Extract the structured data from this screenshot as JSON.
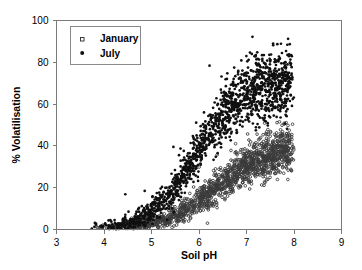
{
  "chart_data": {
    "type": "scatter",
    "title": "",
    "xlabel": "Soil pH",
    "ylabel": "% Volatilisation",
    "xlim": [
      3,
      9
    ],
    "ylim": [
      0,
      100
    ],
    "xticks": [
      3,
      4,
      5,
      6,
      7,
      8,
      9
    ],
    "yticks": [
      0,
      20,
      40,
      60,
      80,
      100
    ],
    "grid": false,
    "legend_position": "top-left",
    "series": [
      {
        "name": "January",
        "marker": "open-square",
        "color": "#3a3a3a",
        "n_points": 1500,
        "description": "Open markers; sigmoidal rise from ~0% at pH 3.7 to a plateau near 38-42% by pH 7.3-8.0",
        "curve": {
          "model": "logistic",
          "plateau": 40,
          "midpoint_ph": 6.35,
          "steepness": 1.85,
          "x_start": 3.7,
          "x_end": 7.95,
          "scatter_sd": 4.2
        },
        "sample_points": [
          {
            "x": 3.8,
            "y": 0.4
          },
          {
            "x": 4.1,
            "y": 0.6
          },
          {
            "x": 4.4,
            "y": 0.9
          },
          {
            "x": 4.7,
            "y": 1.4
          },
          {
            "x": 5.0,
            "y": 2.3
          },
          {
            "x": 5.3,
            "y": 4.0
          },
          {
            "x": 5.6,
            "y": 7.0
          },
          {
            "x": 5.9,
            "y": 12.0
          },
          {
            "x": 6.2,
            "y": 18.0
          },
          {
            "x": 6.5,
            "y": 24.0
          },
          {
            "x": 6.8,
            "y": 30.0
          },
          {
            "x": 7.1,
            "y": 34.5
          },
          {
            "x": 7.4,
            "y": 37.5
          },
          {
            "x": 7.7,
            "y": 39.0
          },
          {
            "x": 7.9,
            "y": 40.0
          }
        ]
      },
      {
        "name": "July",
        "marker": "filled-circle",
        "color": "#101010",
        "n_points": 1500,
        "description": "Filled markers; sigmoidal rise from ~0% at pH 3.7 to a plateau near 68-75% by pH 7.0-8.0",
        "curve": {
          "model": "logistic",
          "plateau": 72,
          "midpoint_ph": 5.95,
          "steepness": 2.05,
          "x_start": 3.7,
          "x_end": 7.95,
          "scatter_sd": 6.0
        },
        "sample_points": [
          {
            "x": 3.8,
            "y": 0.5
          },
          {
            "x": 4.1,
            "y": 0.9
          },
          {
            "x": 4.4,
            "y": 1.6
          },
          {
            "x": 4.7,
            "y": 2.8
          },
          {
            "x": 5.0,
            "y": 5.5
          },
          {
            "x": 5.3,
            "y": 11.0
          },
          {
            "x": 5.6,
            "y": 20.0
          },
          {
            "x": 5.9,
            "y": 32.0
          },
          {
            "x": 6.2,
            "y": 44.0
          },
          {
            "x": 6.5,
            "y": 54.0
          },
          {
            "x": 6.8,
            "y": 61.0
          },
          {
            "x": 7.1,
            "y": 66.0
          },
          {
            "x": 7.4,
            "y": 69.0
          },
          {
            "x": 7.7,
            "y": 71.0
          },
          {
            "x": 7.9,
            "y": 72.0
          }
        ]
      }
    ]
  },
  "axes": {
    "x_title": "Soil pH",
    "y_title": "% Volatilisation",
    "x_tick_labels": [
      "3",
      "4",
      "5",
      "6",
      "7",
      "8",
      "9"
    ],
    "y_tick_labels": [
      "0",
      "20",
      "40",
      "60",
      "80",
      "100"
    ]
  },
  "legend": {
    "entries": [
      {
        "label": "January",
        "marker": "open-square"
      },
      {
        "label": "July",
        "marker": "filled-circle"
      }
    ]
  },
  "style": {
    "axis_color": "#7a7a7a",
    "text_color": "#000000",
    "background": "#ffffff",
    "january_color": "#3a3a3a",
    "july_color": "#101010"
  }
}
